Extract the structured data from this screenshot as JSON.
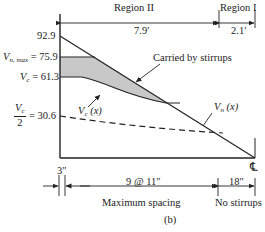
{
  "figure": {
    "caption": "(b)",
    "regions": [
      {
        "label": "Region II",
        "length": "7.9′"
      },
      {
        "label": "Region I",
        "length": "2.1′"
      }
    ],
    "y_labels": {
      "top": "92.9",
      "vn_max_symbol": "V",
      "vn_max_sub": "n, max",
      "vn_max_value": "= 75.9",
      "vc_symbol": "V",
      "vc_sub": "c",
      "vc_value": "= 61.3",
      "vc_half_num_symbol": "V",
      "vc_half_num_sub": "c",
      "vc_half_den": "2",
      "vc_half_value": "= 30.6"
    },
    "curve_labels": {
      "stirrups": "Carried by stirrups",
      "vc_x_symbol": "V",
      "vc_x_sub": "c",
      "vc_x_arg": "(x)",
      "vn_x_symbol": "V",
      "vn_x_sub": "n",
      "vn_x_arg": "(x)"
    },
    "centerline": "℄",
    "spacing": {
      "first": "3″",
      "middle": "9 @ 11″",
      "last": "18″",
      "middle_note": "Maximum spacing",
      "last_note": "No stirrups"
    },
    "colors": {
      "line": "#222222",
      "shade": "#c8c8c8"
    }
  }
}
